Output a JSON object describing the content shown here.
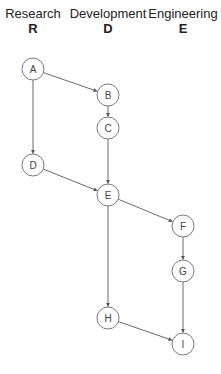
{
  "lanes": [
    {
      "name": "Research",
      "code": "R",
      "x": 33
    },
    {
      "name": "Development",
      "code": "D",
      "x": 108
    },
    {
      "name": "Engineering",
      "code": "E",
      "x": 183
    }
  ],
  "nodes": [
    {
      "id": "A",
      "label": "A",
      "lane": "R",
      "x": 33,
      "y": 69
    },
    {
      "id": "B",
      "label": "B",
      "lane": "D",
      "x": 108,
      "y": 95
    },
    {
      "id": "C",
      "label": "C",
      "lane": "D",
      "x": 108,
      "y": 128
    },
    {
      "id": "D",
      "label": "D",
      "lane": "R",
      "x": 33,
      "y": 165
    },
    {
      "id": "E",
      "label": "E",
      "lane": "D",
      "x": 108,
      "y": 195
    },
    {
      "id": "F",
      "label": "F",
      "lane": "E",
      "x": 183,
      "y": 226
    },
    {
      "id": "G",
      "label": "G",
      "lane": "E",
      "x": 183,
      "y": 271
    },
    {
      "id": "H",
      "label": "H",
      "lane": "D",
      "x": 108,
      "y": 318
    },
    {
      "id": "I",
      "label": "I",
      "lane": "E",
      "x": 183,
      "y": 344
    }
  ],
  "edges": [
    {
      "from": "A",
      "to": "B"
    },
    {
      "from": "A",
      "to": "D"
    },
    {
      "from": "B",
      "to": "C"
    },
    {
      "from": "C",
      "to": "E"
    },
    {
      "from": "D",
      "to": "E"
    },
    {
      "from": "E",
      "to": "F"
    },
    {
      "from": "E",
      "to": "H"
    },
    {
      "from": "F",
      "to": "G"
    },
    {
      "from": "G",
      "to": "I"
    },
    {
      "from": "H",
      "to": "I"
    }
  ],
  "style": {
    "node_radius": 11,
    "node_stroke": "#7a7a7a",
    "edge_color": "#6a6a6a",
    "text_color": "#222222"
  }
}
